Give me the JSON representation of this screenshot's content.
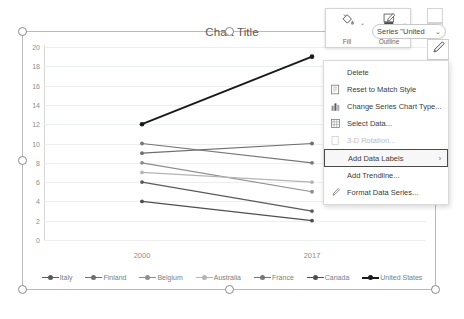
{
  "chart_data": {
    "type": "line",
    "title": "Chart Title",
    "xlabel": "",
    "ylabel": "",
    "categories": [
      "2000",
      "2017"
    ],
    "ylim": [
      0,
      20
    ],
    "yticks": [
      20,
      18,
      16,
      14,
      12,
      10,
      8,
      6,
      4,
      2,
      0
    ],
    "grid": true,
    "legend_position": "bottom",
    "series": [
      {
        "name": "Italy",
        "values": [
          6,
          3
        ],
        "color": "#5a5a5a"
      },
      {
        "name": "Finland",
        "values": [
          9,
          10
        ],
        "color": "#6e6e6e"
      },
      {
        "name": "Belgium",
        "values": [
          8,
          5
        ],
        "color": "#8e8e8e"
      },
      {
        "name": "Australia",
        "values": [
          7,
          6
        ],
        "color": "#b4b4b4"
      },
      {
        "name": "France",
        "values": [
          10,
          8
        ],
        "color": "#777777"
      },
      {
        "name": "Canada",
        "values": [
          4,
          2
        ],
        "color": "#4f4f4f"
      },
      {
        "name": "United States",
        "values": [
          12,
          19
        ],
        "color": "#1a1a1a"
      }
    ]
  },
  "mini_toolbar": {
    "fill_label": "Fill",
    "outline_label": "Outline",
    "fill_icon": "fill-bucket-icon",
    "outline_icon": "outline-pen-icon",
    "caret": "⌄"
  },
  "series_select": {
    "value": "Series \"United",
    "caret": "⌄"
  },
  "context_menu": {
    "items": [
      {
        "label": "Delete",
        "icon": "none",
        "state": "normal",
        "submenu": false
      },
      {
        "label": "Reset to Match Style",
        "icon": "reset-style-icon",
        "state": "normal",
        "submenu": false
      },
      {
        "label": "Change Series Chart Type...",
        "icon": "chart-type-icon",
        "state": "normal",
        "submenu": false
      },
      {
        "label": "Select Data...",
        "icon": "select-data-icon",
        "state": "normal",
        "submenu": false
      },
      {
        "label": "3-D Rotation...",
        "icon": "rotation-3d-icon",
        "state": "disabled",
        "submenu": false
      },
      {
        "label": "Add Data Labels",
        "icon": "none",
        "state": "highlighted",
        "submenu": true
      },
      {
        "label": "Add Trendline...",
        "icon": "none",
        "state": "normal",
        "submenu": false
      },
      {
        "label": "Format Data Series...",
        "icon": "format-brush-icon",
        "state": "normal",
        "submenu": false
      }
    ],
    "submenu_arrow": "›"
  },
  "colors": {
    "grid": "#eceff1",
    "axis": "#d6d6d6",
    "selection_border": "#b9b9b9",
    "tick_text": "#8c8c8c",
    "title_text": "#595959",
    "highlight_border": "#4a4a4a"
  }
}
